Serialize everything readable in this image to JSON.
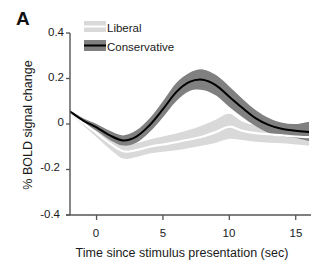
{
  "figure": {
    "panel_label": "A",
    "background": "#ffffff"
  },
  "axes": {
    "ylabel": "% BOLD signal change",
    "xlabel": "Time since stimulus presentation (sec)",
    "yticks": [
      "0.4",
      "0.2",
      "0",
      "-0.2",
      "-0.4"
    ],
    "xticks": [
      "0",
      "5",
      "10",
      "15"
    ],
    "axis_color": "#555555"
  },
  "legend": {
    "items": [
      {
        "label": "Liberal",
        "color": "#d9d9d9",
        "line_color": "#ffffff"
      },
      {
        "label": "Conservative",
        "color": "#808080",
        "line_color": "#000000"
      }
    ]
  },
  "chart_data": {
    "type": "line",
    "title": "",
    "xlabel": "Time since stimulus presentation (sec)",
    "ylabel": "% BOLD signal change",
    "xlim": [
      -2,
      16
    ],
    "ylim": [
      -0.4,
      0.4
    ],
    "grid": false,
    "legend_position": "top-left-inside",
    "error_band": "shaded standard error",
    "x": [
      -2,
      -1,
      0,
      1,
      2,
      3,
      4,
      5,
      6,
      7,
      8,
      9,
      10,
      11,
      12,
      13,
      14,
      15,
      16
    ],
    "series": [
      {
        "name": "Conservative",
        "color": "#000000",
        "band_color": "#808080",
        "values": [
          0.055,
          0.015,
          -0.015,
          -0.05,
          -0.072,
          -0.055,
          -0.005,
          0.065,
          0.14,
          0.185,
          0.195,
          0.17,
          0.12,
          0.07,
          0.025,
          -0.005,
          -0.022,
          -0.03,
          -0.035
        ],
        "band_upper": [
          0.06,
          0.025,
          0.0,
          -0.03,
          -0.05,
          -0.028,
          0.025,
          0.1,
          0.18,
          0.225,
          0.24,
          0.215,
          0.165,
          0.11,
          0.06,
          0.025,
          0.005,
          0.0,
          0.01
        ],
        "band_lower": [
          0.05,
          0.005,
          -0.03,
          -0.07,
          -0.095,
          -0.082,
          -0.035,
          0.03,
          0.1,
          0.145,
          0.15,
          0.125,
          0.075,
          0.03,
          -0.01,
          -0.04,
          -0.055,
          -0.062,
          -0.075
        ]
      },
      {
        "name": "Liberal",
        "color": "#ffffff",
        "band_color": "#d9d9d9",
        "values": [
          0.052,
          0.005,
          -0.04,
          -0.085,
          -0.12,
          -0.115,
          -0.1,
          -0.09,
          -0.08,
          -0.068,
          -0.055,
          -0.035,
          -0.012,
          -0.03,
          -0.04,
          -0.045,
          -0.05,
          -0.055,
          -0.058
        ],
        "band_upper": [
          0.058,
          0.015,
          -0.022,
          -0.062,
          -0.092,
          -0.085,
          -0.068,
          -0.055,
          -0.042,
          -0.025,
          -0.005,
          0.02,
          0.045,
          0.01,
          -0.005,
          -0.01,
          -0.018,
          -0.022,
          -0.022
        ],
        "band_lower": [
          0.046,
          -0.005,
          -0.058,
          -0.11,
          -0.152,
          -0.145,
          -0.13,
          -0.122,
          -0.115,
          -0.105,
          -0.095,
          -0.082,
          -0.065,
          -0.07,
          -0.078,
          -0.082,
          -0.085,
          -0.09,
          -0.095
        ]
      }
    ]
  }
}
